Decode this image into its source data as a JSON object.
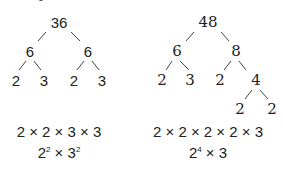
{
  "left_tree": {
    "root": "36",
    "level1": [
      "6",
      "6"
    ],
    "level2": [
      "2",
      "3",
      "2",
      "3"
    ],
    "expanded_product": "2 × 2 × 3 × 3",
    "power_form": {
      "base1": "2",
      "exp1": "2",
      "times": " × ",
      "base2": "3",
      "exp2": "2"
    }
  },
  "right_tree": {
    "root": "48",
    "level1": [
      "6",
      "8"
    ],
    "level2": [
      "2",
      "3",
      "2",
      "4"
    ],
    "level3": [
      "2",
      "2"
    ],
    "expanded_product": "2 × 2 × 2 × 2 × 3",
    "power_form": {
      "base1": "2",
      "exp1": "4",
      "times": " × ",
      "base2": "3"
    }
  }
}
